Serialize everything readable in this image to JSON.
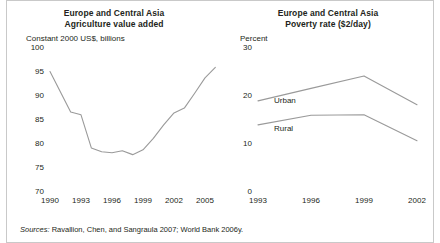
{
  "figure": {
    "background": "#ffffff",
    "line_color": "#9a9a9a",
    "text_color": "#231f20",
    "frame_color": "#c9c9c9",
    "sources_prefix": "Sources:",
    "sources_text": " Ravallion, Chen, and Sangraula 2007; World Bank 2006y."
  },
  "chart_data": [
    {
      "type": "line",
      "panel": "left",
      "title": "Europe and Central Asia\nAgriculture value added",
      "title_line1": "Europe and Central Asia",
      "title_line2": "Agriculture value added",
      "ylabel": "Constant 2000 US$, billions",
      "xlabel": "",
      "ylim": [
        70,
        100
      ],
      "yticks": [
        100,
        95,
        90,
        85,
        80,
        75,
        70
      ],
      "ytick_labels": [
        "100",
        "95",
        "90",
        "85",
        "80",
        "75",
        "70"
      ],
      "xlim": [
        1990,
        2006
      ],
      "xticks": [
        1990,
        1993,
        1996,
        1999,
        2002,
        2005
      ],
      "xtick_labels": [
        "1990",
        "1993",
        "1996",
        "1999",
        "2002",
        "2005"
      ],
      "grid": false,
      "legend": "none",
      "series": [
        {
          "name": "Agriculture value added",
          "x": [
            1990,
            1991,
            1992,
            1993,
            1994,
            1995,
            1996,
            1997,
            1998,
            1999,
            2000,
            2001,
            2002,
            2003,
            2004,
            2005,
            2006
          ],
          "values": [
            95.5,
            91.3,
            87.1,
            86.5,
            79.6,
            78.8,
            78.6,
            79.0,
            78.2,
            79.2,
            81.6,
            84.4,
            86.9,
            87.9,
            91.0,
            94.2,
            96.4
          ]
        }
      ]
    },
    {
      "type": "line",
      "panel": "right",
      "title": "Europe and Central Asia\nPoverty rate ($2/day)",
      "title_line1": "Europe and Central Asia",
      "title_line2": "Poverty rate ($2/day)",
      "ylabel": "Percent",
      "xlabel": "",
      "ylim": [
        0,
        30
      ],
      "yticks": [
        30,
        20,
        10,
        0
      ],
      "ytick_labels": [
        "30",
        "20",
        "10",
        "0"
      ],
      "xlim": [
        1993,
        2002
      ],
      "xticks": [
        1993,
        1996,
        1999,
        2002
      ],
      "xtick_labels": [
        "1993",
        "1996",
        "1999",
        "2002"
      ],
      "grid": false,
      "legend": "inline-labels",
      "series": [
        {
          "name": "Urban",
          "label": "Urban",
          "x": [
            1993,
            1996,
            1999,
            2002
          ],
          "values": [
            19.4,
            22.0,
            24.6,
            18.6
          ]
        },
        {
          "name": "Rural",
          "label": "Rural",
          "x": [
            1993,
            1996,
            1999,
            2002
          ],
          "values": [
            14.4,
            16.4,
            16.5,
            11.1
          ]
        }
      ]
    }
  ]
}
